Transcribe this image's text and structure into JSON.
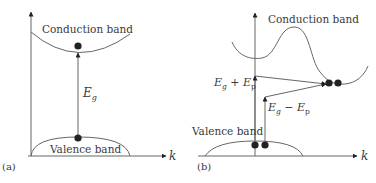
{
  "panel_a": {
    "tag": "(a)",
    "conduction_label": "Conduction band",
    "valence_label": "Valence band",
    "gap_label_main": "E",
    "gap_label_sub": "g",
    "axis_label": "k"
  },
  "panel_b": {
    "tag": "(b)",
    "conduction_label": "Conduction band",
    "valence_label": "Valence band",
    "upper_label": {
      "e1": "E",
      "s1": "g",
      "op": " + ",
      "e2": "E",
      "s2": "p"
    },
    "lower_label": {
      "e1": "E",
      "s1": "g",
      "op": " − ",
      "e2": "E",
      "s2": "p"
    },
    "axis_label": "k"
  },
  "colors": {
    "line": "#555555",
    "dot": "#222222",
    "text": "#3a3a3a"
  }
}
